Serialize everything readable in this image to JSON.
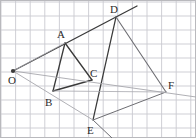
{
  "figure": {
    "background_color": "#ffffff",
    "border_color": "#b9b9bd",
    "grid": {
      "enabled": true,
      "color": "#c9c9d0",
      "cell_width": 14.6,
      "cell_height": 14.0,
      "origin_x": 1,
      "origin_y": 2,
      "columns": 13,
      "rows": 10
    },
    "stroke_colors": {
      "dark": "#3a3a3a",
      "medium": "#6d6d72",
      "light": "#a7a7ad"
    },
    "points": [
      {
        "name": "O",
        "label": "O",
        "x": 13,
        "y": 71,
        "label_x": 8,
        "label_y": 84,
        "dot": true
      },
      {
        "name": "A",
        "label": "A",
        "x": 65,
        "y": 43,
        "label_x": 57,
        "label_y": 38,
        "dot": false
      },
      {
        "name": "B",
        "label": "B",
        "x": 53,
        "y": 91,
        "label_x": 45,
        "label_y": 106,
        "dot": false
      },
      {
        "name": "C",
        "label": "C",
        "x": 92,
        "y": 80,
        "label_x": 90,
        "label_y": 77,
        "dot": false
      },
      {
        "name": "D",
        "label": "D",
        "x": 116,
        "y": 17,
        "label_x": 110,
        "label_y": 13,
        "dot": false
      },
      {
        "name": "E",
        "label": "E",
        "x": 93,
        "y": 120,
        "label_x": 87,
        "label_y": 134,
        "dot": false
      },
      {
        "name": "F",
        "label": "F",
        "x": 166,
        "y": 92,
        "label_x": 168,
        "label_y": 89,
        "dot": false
      }
    ],
    "segments": [
      {
        "name": "ray-O-A-D",
        "from": [
          13,
          71
        ],
        "to": [
          137,
          6
        ],
        "tone": "dark",
        "width": 1.3
      },
      {
        "name": "segment-A-B",
        "from": [
          65,
          43
        ],
        "to": [
          53,
          91
        ],
        "tone": "dark",
        "width": 1.3
      },
      {
        "name": "segment-A-C",
        "from": [
          65,
          43
        ],
        "to": [
          92,
          80
        ],
        "tone": "dark",
        "width": 1.3
      },
      {
        "name": "segment-B-C",
        "from": [
          53,
          91
        ],
        "to": [
          92,
          80
        ],
        "tone": "dark",
        "width": 1.3
      },
      {
        "name": "segment-D-E",
        "from": [
          116,
          17
        ],
        "to": [
          93,
          120
        ],
        "tone": "dark",
        "width": 1.2
      },
      {
        "name": "segment-D-F",
        "from": [
          116,
          17
        ],
        "to": [
          166,
          92
        ],
        "tone": "medium",
        "width": 1.1
      },
      {
        "name": "segment-E-F",
        "from": [
          93,
          120
        ],
        "to": [
          166,
          92
        ],
        "tone": "medium",
        "width": 1.0
      },
      {
        "name": "ray-D-E-extended",
        "from": [
          93,
          120
        ],
        "to": [
          112,
          138
        ],
        "tone": "medium",
        "width": 1.0
      },
      {
        "name": "ray-O-C-F",
        "from": [
          13,
          71
        ],
        "to": [
          196,
          97
        ],
        "tone": "light",
        "width": 0.9
      },
      {
        "name": "ray-O-B-E",
        "from": [
          13,
          71
        ],
        "to": [
          93,
          120
        ],
        "tone": "light",
        "width": 0.9
      },
      {
        "name": "segment-B-F-guide",
        "from": [
          53,
          91
        ],
        "to": [
          166,
          92
        ],
        "tone": "light",
        "width": 0.8
      },
      {
        "name": "segment-O-A-guide",
        "from": [
          13,
          71
        ],
        "to": [
          65,
          43
        ],
        "tone": "light",
        "width": 0.8
      }
    ]
  }
}
